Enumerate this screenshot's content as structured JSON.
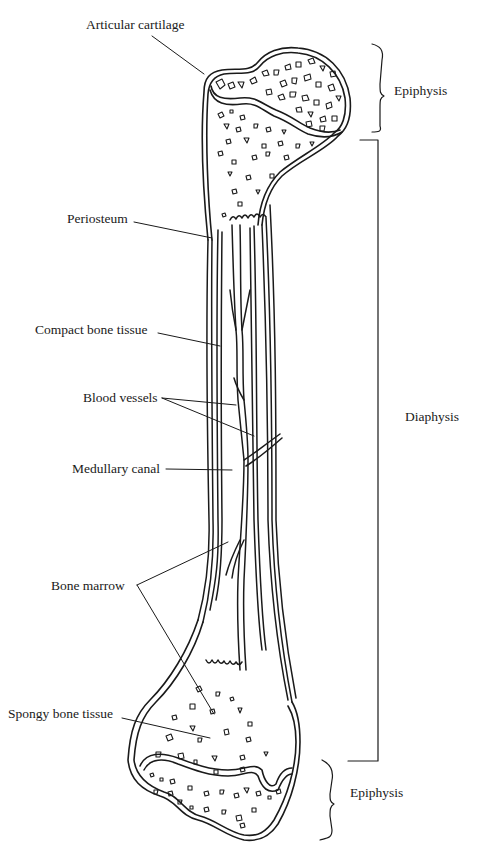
{
  "diagram": {
    "labels": {
      "articular_cartilage": "Articular cartilage",
      "periosteum": "Periosteum",
      "compact_bone": "Compact bone tissue",
      "blood_vessels": "Blood vessels",
      "medullary_canal": "Medullary canal",
      "bone_marrow": "Bone marrow",
      "spongy_bone": "Spongy bone tissue",
      "epiphysis_top": "Epiphysis",
      "diaphysis": "Diaphysis",
      "epiphysis_bottom": "Epiphysis"
    },
    "colors": {
      "ink": "#1a1a1a",
      "background": "#ffffff"
    }
  }
}
